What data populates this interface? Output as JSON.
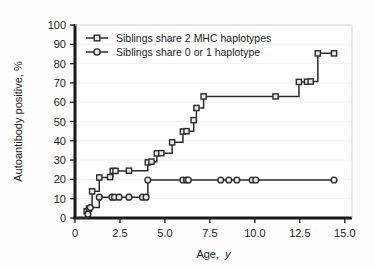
{
  "figure": {
    "background_color": "#fdfdfd",
    "plot_background_color": "#ffffff",
    "axis_color": "#1a1a1a",
    "line_color": "#2b2b2b",
    "marker_fill": "#e8e8e8",
    "grid_color": "#f0f0f0"
  },
  "chart_data": {
    "type": "line",
    "title": "",
    "subtitle": "",
    "xlabel": "Age, y",
    "xlabel_plain": "Age,",
    "xlabel_italic": "y",
    "ylabel": "Autoantibody positive, %",
    "xlim": [
      0,
      15.4
    ],
    "ylim": [
      0,
      100
    ],
    "xticks": [
      0,
      2.5,
      5.0,
      7.5,
      10.0,
      12.5,
      15.0
    ],
    "xtick_labels": [
      "0",
      "2.5",
      "5.0",
      "7.5",
      "10.0",
      "12.5",
      "15.0"
    ],
    "yticks": [
      0,
      10,
      20,
      30,
      40,
      50,
      60,
      70,
      80,
      90,
      100
    ],
    "ytick_labels": [
      "0",
      "10",
      "20",
      "30",
      "40",
      "50",
      "60",
      "70",
      "80",
      "90",
      "100"
    ],
    "grid": false,
    "legend_position": "top-left",
    "step_style": "post",
    "series": [
      {
        "name": "Siblings share 2 MHC haplotypes",
        "marker": "square",
        "points": [
          {
            "x": 0.65,
            "y": 3.5
          },
          {
            "x": 0.78,
            "y": 4.8
          },
          {
            "x": 0.95,
            "y": 13.8
          },
          {
            "x": 1.35,
            "y": 21.0
          },
          {
            "x": 1.95,
            "y": 21.2
          },
          {
            "x": 2.1,
            "y": 24.4
          },
          {
            "x": 2.25,
            "y": 24.4
          },
          {
            "x": 3.0,
            "y": 24.5
          },
          {
            "x": 4.05,
            "y": 28.8
          },
          {
            "x": 4.25,
            "y": 29.2
          },
          {
            "x": 4.55,
            "y": 33.5
          },
          {
            "x": 4.8,
            "y": 33.6
          },
          {
            "x": 5.4,
            "y": 39.2
          },
          {
            "x": 6.0,
            "y": 44.8
          },
          {
            "x": 6.2,
            "y": 45.0
          },
          {
            "x": 6.6,
            "y": 50.7
          },
          {
            "x": 6.75,
            "y": 57.0
          },
          {
            "x": 7.15,
            "y": 63.0
          },
          {
            "x": 11.15,
            "y": 63.0
          },
          {
            "x": 12.45,
            "y": 70.5
          },
          {
            "x": 12.9,
            "y": 70.6
          },
          {
            "x": 13.1,
            "y": 70.7
          },
          {
            "x": 13.5,
            "y": 85.3
          },
          {
            "x": 14.4,
            "y": 85.3
          }
        ]
      },
      {
        "name": "Siblings share 0 or 1 haplotype",
        "marker": "circle",
        "points": [
          {
            "x": 0.72,
            "y": 2.0
          },
          {
            "x": 0.85,
            "y": 5.4
          },
          {
            "x": 1.35,
            "y": 10.8
          },
          {
            "x": 2.05,
            "y": 10.8
          },
          {
            "x": 2.2,
            "y": 10.8
          },
          {
            "x": 2.45,
            "y": 10.8
          },
          {
            "x": 3.0,
            "y": 10.8
          },
          {
            "x": 3.75,
            "y": 10.8
          },
          {
            "x": 3.95,
            "y": 10.8
          },
          {
            "x": 4.05,
            "y": 19.7
          },
          {
            "x": 6.0,
            "y": 19.7
          },
          {
            "x": 6.2,
            "y": 19.7
          },
          {
            "x": 6.3,
            "y": 19.7
          },
          {
            "x": 8.1,
            "y": 19.7
          },
          {
            "x": 8.55,
            "y": 19.7
          },
          {
            "x": 9.0,
            "y": 19.7
          },
          {
            "x": 9.85,
            "y": 19.7
          },
          {
            "x": 10.05,
            "y": 19.7
          },
          {
            "x": 14.4,
            "y": 19.7
          }
        ]
      }
    ],
    "legend": [
      {
        "label": "Siblings share 2 MHC haplotypes",
        "marker": "square"
      },
      {
        "label": "Siblings share 0 or 1 haplotype",
        "marker": "circle"
      }
    ]
  }
}
